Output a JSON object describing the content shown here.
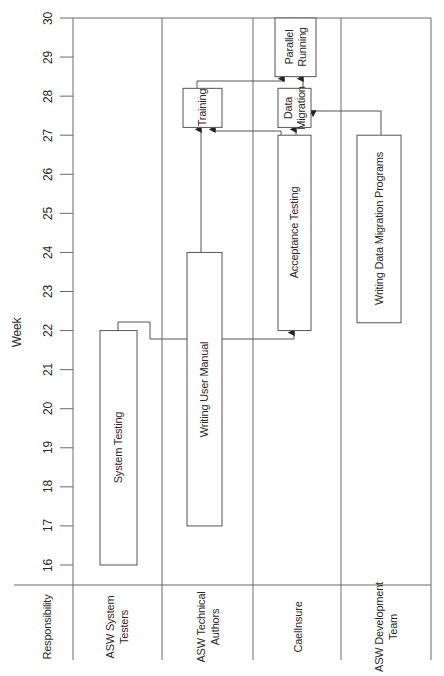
{
  "chart_data": {
    "type": "gantt",
    "title": "",
    "ylabel": "Week",
    "xlabel": "Responsibility",
    "ylim": [
      16,
      30
    ],
    "y_ticks": [
      16,
      17,
      18,
      19,
      20,
      21,
      22,
      23,
      24,
      25,
      26,
      27,
      28,
      29,
      30
    ],
    "orientation": "vertical-time, rotated text",
    "lanes": [
      {
        "name": "ASW System Testers",
        "lines": [
          "ASW System",
          "Testers"
        ]
      },
      {
        "name": "ASW Technical Authors",
        "lines": [
          "ASW Technical",
          "Authors"
        ]
      },
      {
        "name": "CaelInsure",
        "lines": [
          "CaelInsure"
        ]
      },
      {
        "name": "ASW Development Team",
        "lines": [
          "ASW Development",
          "Team"
        ]
      }
    ],
    "tasks": [
      {
        "id": "system-testing",
        "label": "System Testing",
        "lines": [
          "System Testing"
        ],
        "lane": 0,
        "start": 16,
        "end": 22
      },
      {
        "id": "writing-user-manual",
        "label": "Writing User Manual",
        "lines": [
          "Writing User Manual"
        ],
        "lane": 1,
        "start": 17,
        "end": 24
      },
      {
        "id": "training",
        "label": "Training",
        "lines": [
          "Training"
        ],
        "lane": 1,
        "start": 27.2,
        "end": 28.2
      },
      {
        "id": "acceptance-testing",
        "label": "Acceptance Testing",
        "lines": [
          "Acceptance Testing"
        ],
        "lane": 2,
        "start": 22,
        "end": 27
      },
      {
        "id": "data-migration",
        "label": "Data Migration",
        "lines": [
          "Data",
          "Migration"
        ],
        "lane": 2,
        "start": 27.2,
        "end": 28.2
      },
      {
        "id": "parallel-running",
        "label": "Parallel Running",
        "lines": [
          "Parallel",
          "Running"
        ],
        "lane": 2,
        "start": 28.5,
        "end": 30
      },
      {
        "id": "writing-data-migration-programs",
        "label": "Writing Data Migration Programs",
        "lines": [
          "Writing Data Migration Programs"
        ],
        "lane": 3,
        "start": 22.2,
        "end": 27
      }
    ],
    "dependencies": [
      {
        "from": "system-testing",
        "to": "acceptance-testing"
      },
      {
        "from": "writing-user-manual",
        "to": "training"
      },
      {
        "from": "acceptance-testing",
        "to": "training"
      },
      {
        "from": "acceptance-testing",
        "to": "data-migration"
      },
      {
        "from": "writing-data-migration-programs",
        "to": "data-migration"
      },
      {
        "from": "training",
        "to": "parallel-running"
      },
      {
        "from": "data-migration",
        "to": "parallel-running"
      }
    ]
  },
  "labels": {
    "week_axis": "Week",
    "responsibility_header": "Responsibility"
  },
  "colors": {
    "line": "#6b6b6b",
    "box_border": "#555555",
    "text": "#2a2a2a",
    "background": "#ffffff"
  }
}
